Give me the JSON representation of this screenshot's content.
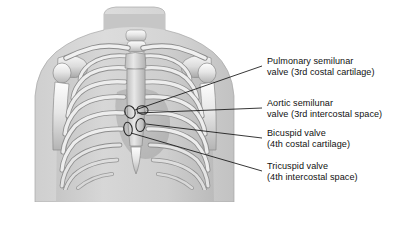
{
  "figure": {
    "type": "anatomical-illustration",
    "view": "anterior",
    "palette": {
      "background": "#ffffff",
      "skin_outer": "#d8d8d8",
      "skin_inner": "#c9c9c9",
      "soft_tissue": "#bdbdbd",
      "bone_light": "#f2f2f2",
      "bone_mid": "#d2d2d2",
      "bone_shadow": "#9a9a9a",
      "heart_shadow": "#a8a8a8",
      "outline": "#6e6e6e",
      "leader_line": "#1a1a1a",
      "text": "#111111"
    }
  },
  "labels": [
    {
      "id": "pulmonary",
      "name": "pulmonary-semilunar-valve",
      "line1": "Pulmonary semilunar",
      "line2": "valve (3rd costal cartilage)",
      "marker": {
        "cx": 130,
        "cy": 112,
        "rx": 5.0,
        "ry": 6.4,
        "rot": -22
      },
      "leader": {
        "x1": 135,
        "y1": 110,
        "x2": 262,
        "y2": 66
      }
    },
    {
      "id": "aortic",
      "name": "aortic-semilunar-valve",
      "line1": "Aortic semilunar",
      "line2": "valve (3rd intercostal space)",
      "marker": {
        "cx": 142.5,
        "cy": 110,
        "rx": 5.6,
        "ry": 4.2,
        "rot": 10
      },
      "leader": {
        "x1": 137,
        "y1": 113,
        "x2": 262,
        "y2": 108
      }
    },
    {
      "id": "bicuspid",
      "name": "bicuspid-valve",
      "line1": "Bicuspid valve",
      "line2": "(4th costal cartilage)",
      "marker": {
        "cx": 140.5,
        "cy": 125,
        "rx": 4.6,
        "ry": 6.6,
        "rot": 8
      },
      "leader": {
        "x1": 146,
        "y1": 124,
        "x2": 262,
        "y2": 138
      }
    },
    {
      "id": "tricuspid",
      "name": "tricuspid-valve",
      "line1": "Tricuspid valve",
      "line2": "(4th intercostal space)",
      "marker": {
        "cx": 128,
        "cy": 129,
        "rx": 4.2,
        "ry": 6.8,
        "rot": -8
      },
      "leader": {
        "x1": 131,
        "y1": 133,
        "x2": 262,
        "y2": 171
      }
    }
  ],
  "anatomy": {
    "structures": [
      "neck",
      "shoulders",
      "left-clavicle",
      "right-clavicle",
      "left-scapula",
      "right-scapula",
      "left-humerus",
      "right-humerus",
      "sternum-manubrium",
      "sternum-body",
      "xiphoid-process",
      "cervical-vertebrae",
      "rib-pairs-1-through-10",
      "costal-cartilages",
      "heart-shadow"
    ],
    "rib_pair_count": 10
  }
}
